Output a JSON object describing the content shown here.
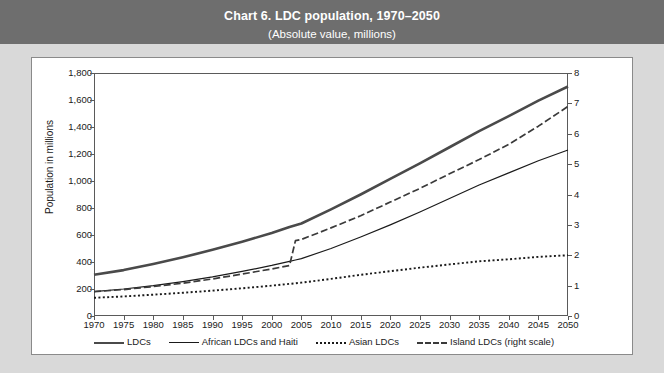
{
  "header": {
    "title": "Chart 6. LDC population, 1970–2050",
    "subtitle": "(Absolute value, millions)",
    "band_color": "#6e6e6e"
  },
  "chart_data": {
    "type": "line",
    "title": "Chart 6. LDC population, 1970–2050",
    "subtitle": "(Absolute value, millions)",
    "xlabel": "",
    "ylabel": "Population in millions",
    "ylabel_right": "",
    "xlim": [
      1970,
      2050
    ],
    "ylim": [
      0,
      1800
    ],
    "ylim_right": [
      0,
      8
    ],
    "grid": true,
    "legend_position": "bottom",
    "x": [
      1970,
      1975,
      1980,
      1985,
      1990,
      1995,
      2000,
      2003,
      2004,
      2005,
      2010,
      2015,
      2020,
      2025,
      2030,
      2035,
      2040,
      2045,
      2050
    ],
    "xticks": [
      "1970",
      "1975",
      "1980",
      "1985",
      "1990",
      "1995",
      "2000",
      "2005",
      "2010",
      "2015",
      "2020",
      "2025",
      "2030",
      "2035",
      "2040",
      "2045",
      "2050"
    ],
    "yticks_left": [
      "0",
      "200",
      "400",
      "600",
      "800",
      "1,000",
      "1,200",
      "1,400",
      "1,600",
      "1,800"
    ],
    "yticks_right": [
      "0",
      "1",
      "2",
      "3",
      "4",
      "5",
      "6",
      "7",
      "8"
    ],
    "series": [
      {
        "name": "LDCs",
        "axis": "left",
        "style": "solid-thick",
        "color": "#4a4a4a",
        "values": [
          305,
          340,
          385,
          435,
          490,
          550,
          615,
          660,
          672,
          685,
          790,
          900,
          1015,
          1130,
          1250,
          1370,
          1480,
          1595,
          1700
        ]
      },
      {
        "name": "African LDCs and Haiti",
        "axis": "left",
        "style": "solid-thin",
        "color": "#1a1a1a",
        "values": [
          180,
          200,
          225,
          255,
          290,
          330,
          375,
          405,
          415,
          425,
          500,
          585,
          675,
          770,
          870,
          970,
          1060,
          1150,
          1230
        ]
      },
      {
        "name": "Asian LDCs",
        "axis": "left",
        "style": "dotted",
        "color": "#1a1a1a",
        "values": [
          135,
          145,
          158,
          172,
          188,
          205,
          225,
          238,
          242,
          247,
          275,
          305,
          332,
          358,
          382,
          405,
          420,
          438,
          450
        ]
      },
      {
        "name": "Island LDCs (right scale)",
        "axis": "right",
        "style": "dashed",
        "color": "#3a3a3a",
        "values": [
          0.8,
          0.87,
          0.97,
          1.08,
          1.22,
          1.38,
          1.55,
          1.66,
          2.48,
          2.52,
          2.9,
          3.3,
          3.75,
          4.2,
          4.68,
          5.15,
          5.65,
          6.25,
          6.9
        ]
      }
    ]
  },
  "legend": {
    "items": [
      {
        "label": "LDCs"
      },
      {
        "label": "African LDCs and Haiti"
      },
      {
        "label": "Asian LDCs"
      },
      {
        "label": "Island LDCs (right scale)"
      }
    ]
  }
}
